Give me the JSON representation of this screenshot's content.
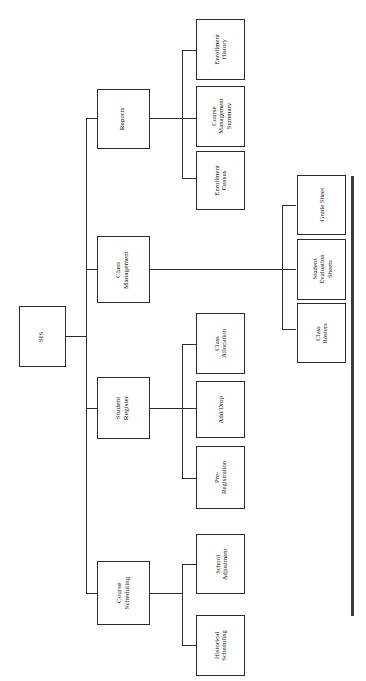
{
  "diagram": {
    "type": "hierarchy-tree",
    "orientation": "rotated-90-ccw",
    "title": "",
    "root": {
      "label": "SIS"
    },
    "nodes": [
      {
        "id": "sis",
        "label": "SIS",
        "level": 0
      },
      {
        "id": "reports",
        "label": "Reports",
        "level": 1
      },
      {
        "id": "class-mgmt",
        "label": "Class\nManagement",
        "level": 1
      },
      {
        "id": "student-reg",
        "label": "Student\nRegister",
        "level": 1
      },
      {
        "id": "course-sched",
        "label": "Course\nScheduling",
        "level": 1
      },
      {
        "id": "enroll-history",
        "label": "Enrollment\nHistory",
        "level": 2
      },
      {
        "id": "course-summary",
        "label": "Course\nManagement\nSummary",
        "level": 2
      },
      {
        "id": "enroll-census",
        "label": "Enrollment\nCensus",
        "level": 2
      },
      {
        "id": "grade-sheet",
        "label": "Grade Sheet",
        "level": 2
      },
      {
        "id": "student-eval",
        "label": "Student\nEvaluation\nSheets",
        "level": 2
      },
      {
        "id": "class-rosters",
        "label": "Class\nRosters",
        "level": 2
      },
      {
        "id": "class-alloc",
        "label": "Class\nAllocation",
        "level": 2
      },
      {
        "id": "add-drop",
        "label": "Add/Drop",
        "level": 2
      },
      {
        "id": "pre-reg",
        "label": "Pre-\nRegistration",
        "level": 2
      },
      {
        "id": "school-adj",
        "label": "School\nAdjustment",
        "level": 2
      },
      {
        "id": "hist-sched",
        "label": "Historical\nScheduling",
        "level": 2
      }
    ],
    "edges": [
      {
        "from": "sis",
        "to": "reports"
      },
      {
        "from": "sis",
        "to": "class-mgmt"
      },
      {
        "from": "sis",
        "to": "student-reg"
      },
      {
        "from": "sis",
        "to": "course-sched"
      },
      {
        "from": "reports",
        "to": "enroll-history"
      },
      {
        "from": "reports",
        "to": "course-summary"
      },
      {
        "from": "reports",
        "to": "enroll-census"
      },
      {
        "from": "class-mgmt",
        "to": "grade-sheet"
      },
      {
        "from": "class-mgmt",
        "to": "student-eval"
      },
      {
        "from": "class-mgmt",
        "to": "class-rosters"
      },
      {
        "from": "student-reg",
        "to": "class-alloc"
      },
      {
        "from": "student-reg",
        "to": "add-drop"
      },
      {
        "from": "student-reg",
        "to": "pre-reg"
      },
      {
        "from": "course-sched",
        "to": "school-adj"
      },
      {
        "from": "course-sched",
        "to": "hist-sched"
      }
    ],
    "colors": {
      "box_border": "#2a2a2a",
      "line": "#2b2b2b",
      "rule": "#3a3a3a",
      "background": "#ffffff",
      "text": "#111111"
    }
  }
}
